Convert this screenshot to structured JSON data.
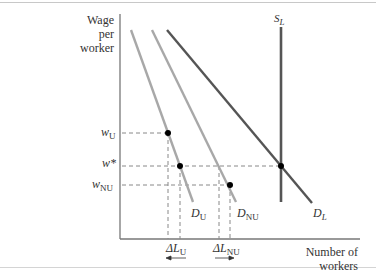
{
  "axes": {
    "y_label_lines": [
      "Wage",
      "per",
      "worker"
    ],
    "x_label_lines": [
      "Number of",
      "workers"
    ]
  },
  "wage_labels": {
    "w_u": {
      "base": "w",
      "sub": "U"
    },
    "w_star": {
      "base": "w*",
      "sub": ""
    },
    "w_nu": {
      "base": "w",
      "sub": "NU"
    }
  },
  "curve_labels": {
    "s_l": {
      "base": "S",
      "sub": "L"
    },
    "d_u": {
      "base": "D",
      "sub": "U"
    },
    "d_nu": {
      "base": "D",
      "sub": "NU"
    },
    "d_l": {
      "base": "D",
      "sub": "L"
    }
  },
  "delta_labels": {
    "delta_l_u": {
      "base": "ΔL",
      "sub": "U",
      "arrow": "left"
    },
    "delta_l_nu": {
      "base": "ΔL",
      "sub": "NU",
      "arrow": "right"
    }
  },
  "colors": {
    "light_curve": "#a8a8a8",
    "dark_curve": "#555555",
    "axis": "#777777",
    "dash": "#888888",
    "point": "#000000"
  }
}
